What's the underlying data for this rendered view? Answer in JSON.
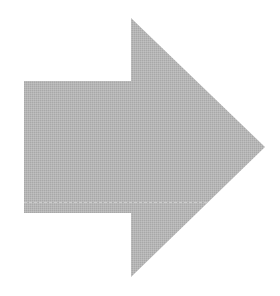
{
  "image": {
    "subject": "right-arrow",
    "background_color": "#ffffff",
    "fill_color": "#b4b4b4",
    "highlight_line_color": "#cfcfcf",
    "shape": {
      "shaft": {
        "x": 24,
        "y": 81,
        "width": 107,
        "height": 132
      },
      "head": {
        "top": [
          131,
          18
        ],
        "tip": [
          265,
          147
        ],
        "bottom": [
          131,
          277
        ]
      }
    }
  }
}
